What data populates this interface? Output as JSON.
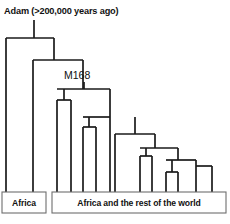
{
  "figure": {
    "kind": "cladogram",
    "title": "Adam (>200,000 years ago)",
    "marker_label": "M168",
    "background_color": "#ffffff",
    "line_color": "#1a1a1a",
    "box_border_color": "#6e6e6e",
    "text_color": "#111111"
  },
  "labels": {
    "root_title": "Adam (>200,000 years ago)",
    "m168": "M168",
    "africa_box": "Africa",
    "world_box": "Africa and the rest of the world"
  },
  "chart_data": {
    "type": "tree",
    "title": "Adam (>200,000 years ago)",
    "annotations": [
      {
        "text": "Adam (>200,000 years ago)",
        "x": 4,
        "y": 14
      },
      {
        "text": "M168",
        "x": 64,
        "y": 79
      }
    ],
    "root_stem": {
      "x": 34,
      "y1": 20,
      "y2": 38
    },
    "m168_stem": {
      "x": 84,
      "y1": 82,
      "y2": 89
    },
    "nodes": [
      {
        "id": "root",
        "y": 38,
        "x1": 6,
        "x2": 54
      },
      {
        "id": "n2",
        "y": 60,
        "x1": 33,
        "x2": 83
      },
      {
        "id": "m168",
        "y": 89,
        "x1": 57,
        "x2": 110
      },
      {
        "id": "n4",
        "y": 100,
        "x1": 57,
        "x2": 71
      },
      {
        "id": "n5",
        "y": 117,
        "x1": 83,
        "x2": 110
      },
      {
        "id": "n6",
        "y": 127,
        "x1": 83,
        "x2": 96
      },
      {
        "id": "n7",
        "y": 134,
        "x1": 115,
        "x2": 155
      },
      {
        "id": "n8",
        "y": 148,
        "x1": 140,
        "x2": 178
      },
      {
        "id": "n9",
        "y": 156,
        "x1": 140,
        "x2": 152
      },
      {
        "id": "n10",
        "y": 160,
        "x1": 166,
        "x2": 196
      },
      {
        "id": "n11",
        "y": 172,
        "x1": 166,
        "x2": 178
      },
      {
        "id": "n12",
        "y": 166,
        "x1": 196,
        "x2": 212
      }
    ],
    "tips": [
      {
        "x": 6,
        "y1": 38,
        "y2": 192
      },
      {
        "x": 33,
        "y1": 60,
        "y2": 192
      },
      {
        "x": 57,
        "y1": 100,
        "y2": 192
      },
      {
        "x": 71,
        "y1": 100,
        "y2": 192
      },
      {
        "x": 83,
        "y1": 127,
        "y2": 192
      },
      {
        "x": 96,
        "y1": 127,
        "y2": 192
      },
      {
        "x": 110,
        "y1": 117,
        "y2": 192
      },
      {
        "x": 115,
        "y1": 134,
        "y2": 192
      },
      {
        "x": 140,
        "y1": 156,
        "y2": 192
      },
      {
        "x": 152,
        "y1": 156,
        "y2": 192
      },
      {
        "x": 166,
        "y1": 172,
        "y2": 192
      },
      {
        "x": 178,
        "y1": 172,
        "y2": 192
      },
      {
        "x": 196,
        "y1": 166,
        "y2": 192
      },
      {
        "x": 212,
        "y1": 166,
        "y2": 192
      }
    ],
    "connectors": [
      {
        "x": 54,
        "y1": 38,
        "y2": 60
      },
      {
        "x": 64,
        "y1": 89,
        "y2": 100
      },
      {
        "x": 83,
        "y1": 60,
        "y2": 89
      },
      {
        "x": 110,
        "y1": 89,
        "y2": 117
      },
      {
        "x": 89,
        "y1": 117,
        "y2": 127
      },
      {
        "x": 135,
        "y1": 117,
        "y2": 134
      },
      {
        "x": 155,
        "y1": 134,
        "y2": 148
      },
      {
        "x": 146,
        "y1": 148,
        "y2": 156
      },
      {
        "x": 178,
        "y1": 148,
        "y2": 160
      },
      {
        "x": 172,
        "y1": 160,
        "y2": 172
      },
      {
        "x": 196,
        "y1": 160,
        "y2": 166
      }
    ],
    "boxes": [
      {
        "id": "africa-box",
        "label": "Africa",
        "x": 2,
        "y": 192,
        "w": 44,
        "h": 21
      },
      {
        "id": "world-box",
        "label": "Africa and the rest of the world",
        "x": 52,
        "y": 192,
        "w": 174,
        "h": 21
      }
    ]
  }
}
